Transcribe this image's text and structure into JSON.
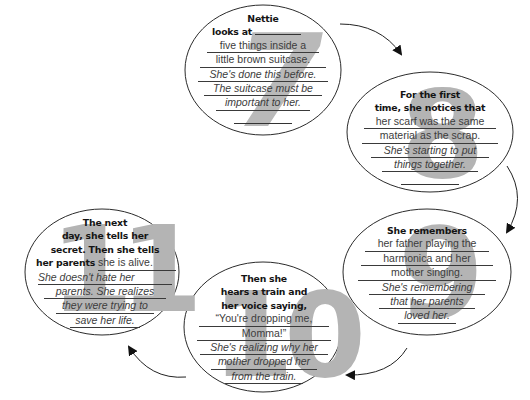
{
  "diagram": {
    "type": "cycle",
    "accent_color": "#b4b4b4",
    "line_color": "#3a3a3a",
    "nodes": [
      {
        "number": "7",
        "prompt": [
          "Nettie",
          "looks at"
        ],
        "answer": [
          "five things inside a",
          "little brown suitcase."
        ],
        "inference": [
          "She's done this before.",
          "The suitcase must be",
          "important to her."
        ]
      },
      {
        "number": "8",
        "prompt": [
          "For the first",
          "time, she notices that"
        ],
        "answer": [
          "her scarf was the same",
          "material as the scrap."
        ],
        "inference": [
          "She's starting to put",
          "things together."
        ]
      },
      {
        "number": "9",
        "prompt": [
          "She remembers"
        ],
        "answer": [
          "her father playing the",
          "harmonica and her",
          "mother singing."
        ],
        "inference": [
          "She's remembering",
          "that her parents",
          "loved her."
        ]
      },
      {
        "number": "10",
        "prompt": [
          "Then she",
          "hears a train and",
          "her voice saying,"
        ],
        "answer": [
          "“You're dropping me,",
          "Momma!”"
        ],
        "inference": [
          "She's realizing why her",
          "mother dropped her",
          "from the train."
        ]
      },
      {
        "number": "11",
        "prompt": [
          "The next",
          "day, she tells her",
          "secret. Then she tells",
          "her parents"
        ],
        "answer": [
          "she is alive."
        ],
        "inference": [
          "She doesn't hate her",
          "parents. She realizes",
          "they were trying to",
          "save her life."
        ]
      }
    ],
    "arrows": [
      {
        "from": "7",
        "to": "8"
      },
      {
        "from": "8",
        "to": "9"
      },
      {
        "from": "9",
        "to": "10"
      },
      {
        "from": "10",
        "to": "11"
      }
    ]
  }
}
